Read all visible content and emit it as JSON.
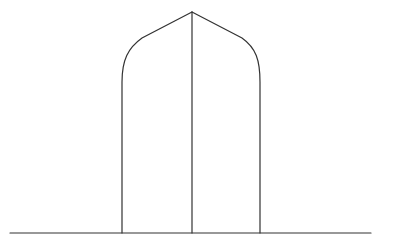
{
  "diagram": {
    "type": "line-drawing",
    "stroke_color": "#333333",
    "background": "#ffffff",
    "elements": {
      "ground_line": {
        "x1": 10,
        "y1": 233,
        "x2": 371,
        "y2": 233
      },
      "left_pillar": {
        "x": 122,
        "y_top": 80,
        "y_bottom": 233
      },
      "center_line": {
        "x": 192,
        "y_top": 12,
        "y_bottom": 233
      },
      "right_pillar": {
        "x": 260,
        "y_top": 80,
        "y_bottom": 233
      },
      "apex": {
        "x": 192,
        "y": 12
      }
    }
  }
}
